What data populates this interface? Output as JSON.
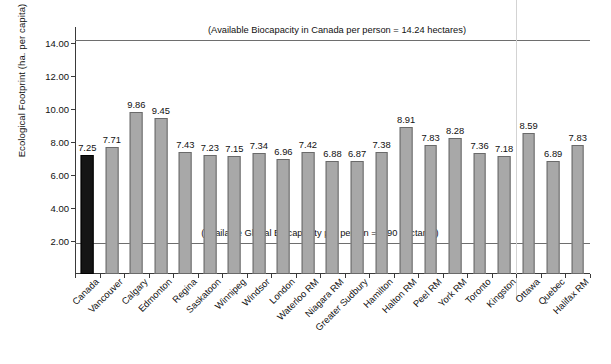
{
  "chart_data": {
    "type": "bar",
    "title": "",
    "xlabel": "",
    "ylabel": "Ecological Footprint (ha. per capita)",
    "ylim": [
      0,
      15
    ],
    "yticks": [
      "2.00",
      "4.00",
      "6.00",
      "8.00",
      "10.00",
      "12.00",
      "14.00"
    ],
    "ytick_values": [
      2,
      4,
      6,
      8,
      10,
      12,
      14
    ],
    "grid": false,
    "legend": "none",
    "categories": [
      "Canada",
      "Vancouver",
      "Calgary",
      "Edmonton",
      "Regina",
      "Saskatoon",
      "Winnipeg",
      "Windsor",
      "London",
      "Waterloo RM",
      "Niagara RM",
      "Greater Sudbury",
      "Hamilton",
      "Halton RM",
      "Peel RM",
      "York RM",
      "Toronto",
      "Kingston",
      "Ottawa",
      "Quebec",
      "Halifax RM"
    ],
    "values": [
      7.25,
      7.71,
      9.86,
      9.45,
      7.43,
      7.23,
      7.15,
      7.34,
      6.96,
      7.42,
      6.88,
      6.87,
      7.38,
      8.91,
      7.83,
      8.28,
      7.36,
      7.18,
      8.59,
      6.89,
      7.83
    ],
    "value_labels": [
      "7.25",
      "7.71",
      "9.86",
      "9.45",
      "7.43",
      "7.23",
      "7.15",
      "7.34",
      "6.96",
      "7.42",
      "6.88",
      "6.87",
      "7.38",
      "8.91",
      "7.83",
      "8.28",
      "7.36",
      "7.18",
      "8.59",
      "6.89",
      "7.83"
    ],
    "highlight_index": 0,
    "bar_color": "#a8a8a8",
    "highlight_color": "#151515",
    "annotations": [
      {
        "name": "canada-biocapacity-line",
        "text": "(Available Biocapacity in Canada per person = 14.24 hectares)",
        "value": 14.24
      },
      {
        "name": "global-biocapacity-line",
        "text": "(Available Global Biocapacity per person = 1.90 hectares)",
        "value": 1.9
      }
    ]
  }
}
